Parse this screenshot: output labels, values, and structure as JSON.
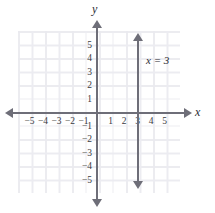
{
  "chart_data": {
    "type": "line",
    "title": "",
    "xlabel": "x",
    "ylabel": "y",
    "xlim": [
      -6,
      6
    ],
    "ylim": [
      -6,
      6
    ],
    "grid": true,
    "legend": "none",
    "annotations": [
      {
        "text": "x = 3",
        "x": 3.6,
        "y": 3.4
      }
    ],
    "series": [
      {
        "name": "x = 3",
        "equation": "x = 3",
        "orientation": "vertical",
        "x": [
          3,
          3
        ],
        "y": [
          -5.4,
          5.4
        ],
        "arrows": "both",
        "color": "#6e6e78"
      }
    ],
    "x_ticks": [
      {
        "value": -5,
        "label": "−5"
      },
      {
        "value": -4,
        "label": "−4"
      },
      {
        "value": -3,
        "label": "−3"
      },
      {
        "value": -2,
        "label": "−2"
      },
      {
        "value": -1,
        "label": "−1"
      },
      {
        "value": 1,
        "label": "1"
      },
      {
        "value": 2,
        "label": "2"
      },
      {
        "value": 3,
        "label": "3"
      },
      {
        "value": 4,
        "label": "4"
      },
      {
        "value": 5,
        "label": "5"
      }
    ],
    "y_ticks": [
      {
        "value": 5,
        "label": "5"
      },
      {
        "value": 4,
        "label": "4"
      },
      {
        "value": 3,
        "label": "3"
      },
      {
        "value": 2,
        "label": "2"
      },
      {
        "value": 1,
        "label": "1"
      },
      {
        "value": -1,
        "label": "−1"
      },
      {
        "value": -2,
        "label": "−2"
      },
      {
        "value": -3,
        "label": "−3"
      },
      {
        "value": -4,
        "label": "−4"
      },
      {
        "value": -5,
        "label": "−5"
      }
    ],
    "colors": {
      "axis": "#6e6e78",
      "grid_major": "#d6d6de",
      "grid_minor": "#ececf1",
      "text": "#2b2b33",
      "background": "#ffffff"
    }
  },
  "axis_names": {
    "x": "x",
    "y": "y"
  },
  "equation_label": "x = 3"
}
